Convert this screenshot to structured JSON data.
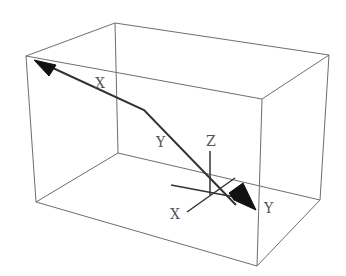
{
  "diagram": {
    "type": "3d-bounding-box-with-path",
    "labels": {
      "path_start": "X",
      "path_mid": "Y",
      "axis_z": "Z",
      "axis_x": "X",
      "path_end": "Y"
    },
    "colors": {
      "box_edge": "#6e6e6e",
      "path": "#333333",
      "arrowhead": "#111111",
      "label": "#555555",
      "background": "#ffffff"
    }
  }
}
